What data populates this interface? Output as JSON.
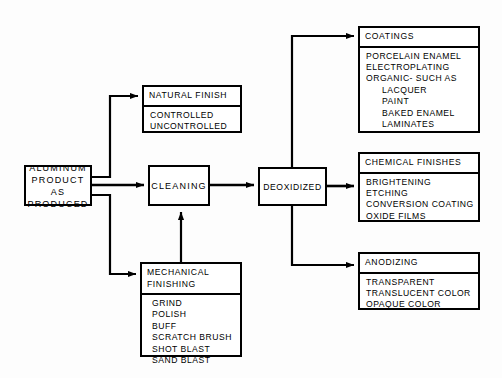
{
  "diagram": {
    "type": "flowchart",
    "stroke_color": "#000000",
    "background_color": "#fdfdfd",
    "nodes": {
      "aluminum": {
        "label": "ALUMINUM\nPRODUCT AS\nPRODUCED"
      },
      "cleaning": {
        "label": "CLEANING"
      },
      "deoxidized": {
        "label": "DEOXIDIZED"
      },
      "natural_finish": {
        "header": "NATURAL FINISH",
        "items": [
          "CONTROLLED",
          "UNCONTROLLED"
        ]
      },
      "mechanical_finishing": {
        "header": "MECHANICAL\nFINISHING",
        "items": [
          "GRIND",
          "POLISH",
          "BUFF",
          "SCRATCH BRUSH",
          "SHOT BLAST",
          "SAND BLAST"
        ]
      },
      "coatings": {
        "header": "COATINGS",
        "items": [
          "PORCELAIN ENAMEL",
          "ELECTROPLATING",
          "ORGANIC- SUCH AS",
          "LACQUER",
          "PAINT",
          "BAKED ENAMEL",
          "LAMINATES"
        ],
        "indented": [
          3,
          4,
          5,
          6
        ]
      },
      "chemical_finishes": {
        "header": "CHEMICAL FINISHES",
        "items": [
          "BRIGHTENING",
          "ETCHING",
          "CONVERSION COATING",
          "OXIDE FILMS"
        ]
      },
      "anodizing": {
        "header": "ANODIZING",
        "items": [
          "TRANSPARENT",
          "TRANSLUCENT COLOR",
          "OPAQUE COLOR"
        ]
      }
    },
    "connections": [
      {
        "from": "aluminum",
        "to": "natural_finish"
      },
      {
        "from": "aluminum",
        "to": "cleaning"
      },
      {
        "from": "aluminum",
        "to": "mechanical_finishing"
      },
      {
        "from": "mechanical_finishing",
        "to": "cleaning"
      },
      {
        "from": "cleaning",
        "to": "deoxidized"
      },
      {
        "from": "deoxidized",
        "to": "coatings"
      },
      {
        "from": "deoxidized",
        "to": "chemical_finishes"
      },
      {
        "from": "deoxidized",
        "to": "anodizing"
      }
    ]
  }
}
